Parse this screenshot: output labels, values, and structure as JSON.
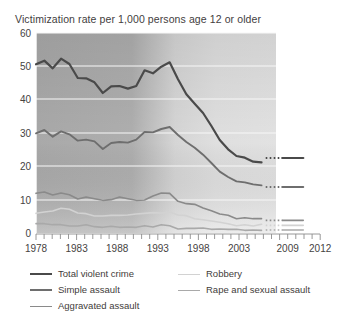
{
  "chart": {
    "title": "Victimization rate per 1,000 persons age 12 or older"
  },
  "legend": {
    "left": [
      {
        "label": "Total violent crime",
        "color": "#4a4a4a",
        "width": 2.2
      },
      {
        "label": "Simple assault",
        "color": "#6e6e6e",
        "width": 1.8
      },
      {
        "label": "Aggravated assault",
        "color": "#8a8a8a",
        "width": 1.6
      }
    ],
    "right": [
      {
        "label": "Robbery",
        "color": "#d2d2d2",
        "width": 1.5
      },
      {
        "label": "Rape and sexual assault",
        "color": "#a9a9a9",
        "width": 1.5
      }
    ]
  },
  "chart_data": {
    "type": "line",
    "title": "Victimization rate per 1,000 persons age 12 or older",
    "xlabel": "",
    "ylabel": "Victimization rate per 1,000 persons age 12 or older",
    "xlim": [
      1978,
      2012
    ],
    "ylim": [
      0,
      60
    ],
    "ytick_values": [
      0,
      10,
      20,
      30,
      40,
      50,
      60
    ],
    "ytick_labels": [
      "0",
      "10",
      "20",
      "30",
      "40",
      "50",
      "60"
    ],
    "xtick_values": [
      1978,
      1983,
      1988,
      1993,
      1998,
      2003,
      2009,
      2012
    ],
    "xtick_labels": [
      "1978",
      "1983",
      "1988",
      "1993",
      "1998",
      "2003",
      "2009",
      "2012"
    ],
    "minor_xticks_every": 1,
    "grid": "horizontal",
    "legend_position": "below",
    "x": [
      1978,
      1979,
      1980,
      1981,
      1982,
      1983,
      1984,
      1985,
      1986,
      1987,
      1988,
      1989,
      1990,
      1991,
      1992,
      1993,
      1994,
      1995,
      1996,
      1997,
      1998,
      1999,
      2000,
      2001,
      2002,
      2003,
      2004,
      2005,
      2006,
      2007,
      2008,
      2009,
      2010
    ],
    "series": [
      {
        "name": "Total violent crime",
        "color": "#4a4a4a",
        "values": [
          50.6,
          51.7,
          49.4,
          52.3,
          50.7,
          46.5,
          46.4,
          45.2,
          42.0,
          44.0,
          44.1,
          43.3,
          44.1,
          48.8,
          47.9,
          49.9,
          51.2,
          46.1,
          41.6,
          38.8,
          36.0,
          32.1,
          27.9,
          25.1,
          23.1,
          22.6,
          21.4,
          21.2,
          25.0,
          20.7,
          19.3,
          17.1,
          19.3
        ],
        "break_segment": {
          "start": 2005.5,
          "end": 2007.5,
          "style": "dotted",
          "value": 22.5
        },
        "tail": {
          "from": 2007.5,
          "to": 2010,
          "values": [
            22.5,
            22.5
          ]
        }
      },
      {
        "name": "Simple assault",
        "color": "#6e6e6e",
        "values": [
          29.9,
          30.9,
          28.9,
          30.5,
          29.6,
          27.7,
          28.0,
          27.5,
          25.2,
          27.0,
          27.3,
          27.1,
          28.0,
          30.3,
          30.2,
          31.2,
          31.8,
          29.4,
          27.3,
          25.6,
          23.5,
          21.0,
          18.4,
          16.8,
          15.5,
          15.2,
          14.6,
          14.3,
          15.0,
          13.5,
          13.3,
          12.9,
          14.0
        ],
        "break_segment": {
          "start": 2005.5,
          "end": 2007.5,
          "style": "dotted",
          "value": 13.8
        },
        "tail": {
          "from": 2007.5,
          "to": 2010,
          "values": [
            13.8,
            13.8
          ]
        }
      },
      {
        "name": "Aggravated assault",
        "color": "#8a8a8a",
        "values": [
          11.9,
          12.3,
          11.4,
          12.0,
          11.5,
          10.2,
          10.8,
          10.3,
          9.8,
          10.0,
          10.8,
          10.3,
          9.8,
          9.9,
          11.1,
          12.0,
          11.9,
          9.5,
          8.8,
          8.6,
          7.5,
          6.7,
          5.7,
          5.3,
          4.3,
          4.6,
          4.3,
          4.3,
          4.6,
          3.9,
          4.4,
          3.2,
          3.8
        ],
        "break_segment": {
          "start": 2005.5,
          "end": 2007.5,
          "style": "dotted",
          "value": 3.8
        },
        "tail": {
          "from": 2007.5,
          "to": 2010,
          "values": [
            3.8,
            3.8
          ]
        }
      },
      {
        "name": "Robbery",
        "color": "#d2d2d2",
        "values": [
          5.9,
          6.3,
          6.6,
          7.4,
          7.1,
          6.0,
          5.8,
          5.1,
          5.1,
          5.3,
          5.3,
          5.4,
          5.7,
          5.9,
          6.1,
          6.0,
          6.3,
          5.4,
          5.2,
          4.3,
          4.0,
          3.6,
          3.2,
          2.8,
          2.2,
          2.5,
          2.1,
          2.6,
          2.6,
          2.4,
          2.2,
          2.1,
          2.4
        ],
        "break_segment": {
          "start": 2005.5,
          "end": 2007.5,
          "style": "dotted",
          "value": 2.3
        },
        "tail": {
          "from": 2007.5,
          "to": 2010,
          "values": [
            2.3,
            2.3
          ]
        }
      },
      {
        "name": "Rape and sexual assault",
        "color": "#a9a9a9",
        "values": [
          2.8,
          2.8,
          2.5,
          2.5,
          2.1,
          2.1,
          2.5,
          1.9,
          1.7,
          2.0,
          1.7,
          1.8,
          1.7,
          2.2,
          1.8,
          2.5,
          2.2,
          1.2,
          1.4,
          1.4,
          1.5,
          1.1,
          1.2,
          1.1,
          1.1,
          0.8,
          0.9,
          0.8,
          1.0,
          0.8,
          0.8,
          0.5,
          0.7
        ],
        "break_segment": {
          "start": 2005.5,
          "end": 2007.5,
          "style": "dotted",
          "value": 0.9
        },
        "tail": {
          "from": 2007.5,
          "to": 2010,
          "values": [
            0.9,
            0.9
          ]
        }
      }
    ],
    "background": {
      "type": "gradient",
      "note": "dark gray panel left of 1993 fading to light gray right of 1993",
      "dark": "#b0b0b0",
      "light": "#e7e7e7",
      "shade_break_year": 1993,
      "panel_end_year": 2008.5
    }
  }
}
